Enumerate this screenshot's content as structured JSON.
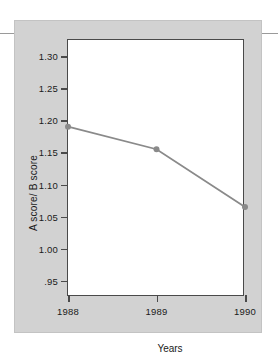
{
  "figure": {
    "panel_background": "#d2d2d2",
    "plot_background": "#ffffff",
    "frame_color": "#4a4a4a",
    "rule_color": "#9a9a9a"
  },
  "chart_data": {
    "type": "line",
    "title": "",
    "xlabel": "Years",
    "ylabel": "A score/ B score",
    "categories": [
      "1988",
      "1989",
      "1990"
    ],
    "x": [
      1988,
      1989,
      1990
    ],
    "values": [
      1.19,
      1.155,
      1.065
    ],
    "series": [
      {
        "name": "A score/ B score",
        "values": [
          1.19,
          1.155,
          1.065
        ],
        "color": "#8a8a8a",
        "marker": "circle"
      }
    ],
    "ylim": [
      0.925,
      1.325
    ],
    "xlim": [
      1988,
      1990
    ],
    "yticks": [
      1.3,
      1.25,
      1.2,
      1.15,
      1.1,
      1.05,
      1.0,
      0.95
    ],
    "ytick_labels": [
      "1.30",
      "1.25",
      "1.20",
      "1.15",
      "1.10",
      "1.05",
      "1.00",
      ".95"
    ],
    "xticks": [
      1988,
      1989,
      1990
    ],
    "xtick_labels": [
      "1988",
      "1989",
      "1990"
    ],
    "grid": false,
    "legend": false,
    "legend_position": "none"
  }
}
